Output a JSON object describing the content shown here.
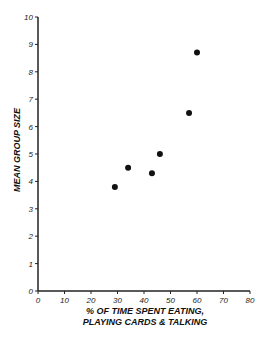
{
  "chart_data": {
    "type": "scatter",
    "title": "",
    "xlabel": "% OF TIME SPENT EATING, PLAYING CARDS & TALKING",
    "xlabel_lines": [
      "% OF TIME SPENT EATING,",
      "PLAYING CARDS & TALKING"
    ],
    "ylabel": "MEAN GROUP SIZE",
    "xlim": [
      0,
      80
    ],
    "ylim": [
      0,
      10
    ],
    "x_ticks": [
      "0",
      "10",
      "20",
      "30",
      "40",
      "50",
      "60",
      "70",
      "80"
    ],
    "y_ticks": [
      "0",
      "1",
      "2",
      "3",
      "4",
      "5",
      "6",
      "7",
      "8",
      "9",
      "10"
    ],
    "grid": false,
    "legend": null,
    "points": [
      {
        "x": 29,
        "y": 3.8
      },
      {
        "x": 34,
        "y": 4.5
      },
      {
        "x": 43,
        "y": 4.3
      },
      {
        "x": 46,
        "y": 5.0
      },
      {
        "x": 57,
        "y": 6.5
      },
      {
        "x": 60,
        "y": 8.7
      }
    ],
    "marker_color": "#111111"
  }
}
